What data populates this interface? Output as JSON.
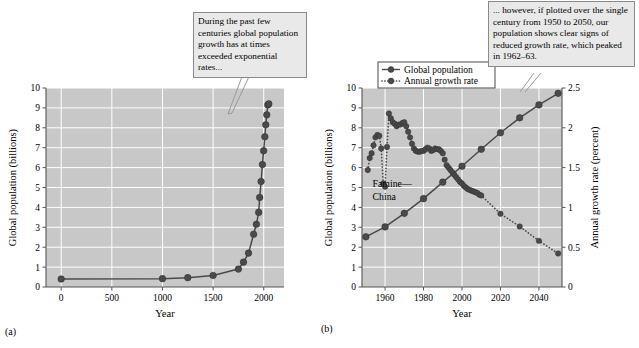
{
  "figure": {
    "panel_a_label": "(a)",
    "panel_b_label": "(b)"
  },
  "callouts": {
    "a": "During the past few centuries global population growth has at times exceeded exponential rates...",
    "b": "... however, if plotted over the single century from 1950 to 2050, our population shows clear signs of reduced growth rate, which peaked in 1962–63."
  },
  "chart_data": [
    {
      "id": "panel-a",
      "type": "line",
      "title": "",
      "xlabel": "Year",
      "ylabel": "Global population (billions)",
      "xlim": [
        -150,
        2200
      ],
      "ylim": [
        0,
        10
      ],
      "xticks": [
        0,
        500,
        1000,
        1500,
        2000
      ],
      "xticklabels": [
        "0",
        "500",
        "1000",
        "1500",
        "2000"
      ],
      "yticks": [
        0,
        1,
        2,
        3,
        4,
        5,
        6,
        7,
        8,
        9,
        10
      ],
      "yticklabels": [
        "0",
        "1",
        "2",
        "3",
        "4",
        "5",
        "6",
        "7",
        "8",
        "9",
        "10"
      ],
      "grid": true,
      "plot_background": "#c8c8c8",
      "gridline_color": "#ffffff",
      "series": [
        {
          "name": "Global population",
          "marker": "filled-circle",
          "line": "solid",
          "color": "#4a4a4a",
          "x": [
            0,
            1000,
            1250,
            1500,
            1750,
            1800,
            1850,
            1900,
            1927,
            1950,
            1960,
            1974,
            1987,
            1999,
            2011,
            2020,
            2030,
            2040,
            2050
          ],
          "y": [
            0.4,
            0.42,
            0.47,
            0.58,
            0.9,
            1.25,
            1.7,
            2.65,
            3.15,
            3.75,
            4.5,
            5.3,
            6.15,
            6.85,
            7.55,
            8.15,
            8.65,
            9.15,
            9.2
          ]
        }
      ]
    },
    {
      "id": "panel-b",
      "type": "line",
      "title": "",
      "xlabel": "Year",
      "ylabel": "Global population (billions)",
      "y2label": "Annual growth rate (percent)",
      "xlim": [
        1948,
        2052
      ],
      "ylim": [
        0,
        10
      ],
      "y2lim": [
        0,
        2.5
      ],
      "xticks": [
        1960,
        1980,
        2000,
        2020,
        2040
      ],
      "xticklabels": [
        "1960",
        "1980",
        "2000",
        "2020",
        "2040"
      ],
      "yticks": [
        0,
        1,
        2,
        3,
        4,
        5,
        6,
        7,
        8,
        9,
        10
      ],
      "yticklabels": [
        "0",
        "1",
        "2",
        "3",
        "4",
        "5",
        "6",
        "7",
        "8",
        "9",
        "10"
      ],
      "y2ticks": [
        0,
        0.5,
        1,
        1.5,
        2,
        2.5
      ],
      "y2ticklabels": [
        "0",
        "0.5",
        "1",
        "1.5",
        "2",
        "2.5"
      ],
      "grid": true,
      "plot_background": "#c8c8c8",
      "gridline_color": "#ffffff",
      "legend_position": "top-left",
      "annotations": [
        {
          "text": "Famine—",
          "x": 1953.5,
          "y": 5.05
        },
        {
          "text": "China",
          "x": 1953.5,
          "y": 4.35
        }
      ],
      "series": [
        {
          "name": "Global population",
          "axis": "left",
          "marker": "filled-circle",
          "line": "solid",
          "color": "#4a4a4a",
          "unit": "billions",
          "x": [
            1950,
            1960,
            1970,
            1980,
            1990,
            2000,
            2010,
            2020,
            2030,
            2040,
            2050
          ],
          "y": [
            2.52,
            3.02,
            3.7,
            4.44,
            5.27,
            6.07,
            6.92,
            7.75,
            8.5,
            9.15,
            9.73
          ]
        },
        {
          "name": "Annual growth rate",
          "axis": "right",
          "marker": "filled-circle",
          "line": "dotted",
          "color": "#4a4a4a",
          "unit": "percent",
          "x": [
            1951,
            1952,
            1953,
            1954,
            1955,
            1956,
            1957,
            1958,
            1959,
            1960,
            1961,
            1962,
            1963,
            1964,
            1965,
            1966,
            1967,
            1968,
            1969,
            1970,
            1971,
            1972,
            1973,
            1974,
            1975,
            1976,
            1977,
            1978,
            1979,
            1980,
            1981,
            1982,
            1983,
            1984,
            1985,
            1986,
            1987,
            1988,
            1989,
            1990,
            1991,
            1992,
            1993,
            1994,
            1995,
            1996,
            1997,
            1998,
            1999,
            2000,
            2001,
            2002,
            2003,
            2004,
            2005,
            2006,
            2007,
            2008,
            2009,
            2010,
            2020,
            2030,
            2040,
            2050
          ],
          "y": [
            1.47,
            1.62,
            1.68,
            1.78,
            1.88,
            1.91,
            1.9,
            1.74,
            1.3,
            1.26,
            1.76,
            2.18,
            2.12,
            2.07,
            2.05,
            2.02,
            2.04,
            2.04,
            2.06,
            2.07,
            2.02,
            1.95,
            1.88,
            1.8,
            1.74,
            1.71,
            1.7,
            1.7,
            1.71,
            1.71,
            1.73,
            1.75,
            1.74,
            1.71,
            1.72,
            1.74,
            1.73,
            1.73,
            1.71,
            1.68,
            1.6,
            1.53,
            1.5,
            1.47,
            1.44,
            1.41,
            1.38,
            1.35,
            1.32,
            1.3,
            1.27,
            1.25,
            1.23,
            1.22,
            1.21,
            1.2,
            1.19,
            1.18,
            1.16,
            1.15,
            0.92,
            0.76,
            0.58,
            0.42
          ]
        }
      ]
    }
  ],
  "legend": {
    "items": [
      {
        "label": "Global population",
        "line": "solid"
      },
      {
        "label": "Annual growth rate",
        "line": "dotted"
      }
    ]
  },
  "colors": {
    "plot_background": "#c8c8c8",
    "gridline": "#ffffff",
    "series": "#4a4a4a",
    "callout_background": "#e9e9e9",
    "callout_border": "#8a8a8a",
    "axis": "#555555"
  }
}
